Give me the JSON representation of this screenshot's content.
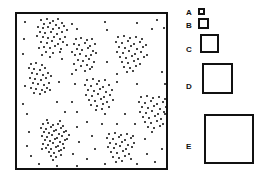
{
  "figure": {
    "title": "",
    "type": "scatter-with-size-legend",
    "width": 259,
    "height": 185,
    "background": "#ffffff",
    "ink_color": "#0a0a0a"
  },
  "plot": {
    "name": "point-pattern-plot",
    "frame": {
      "x": 15,
      "y": 12,
      "width": 153,
      "height": 158
    },
    "border_color": "#111111",
    "border_width": 2,
    "axis_labels_shown": false,
    "tick_labels_shown": false,
    "gridlines": false
  },
  "legend": {
    "name": "size-legend",
    "orientation": "vertical",
    "position": "right",
    "border_color": "#111111",
    "border_width": 2,
    "fill_color": "#ffffff",
    "items": [
      {
        "label": "A",
        "size": 7,
        "label_x": 2,
        "label_y": 9,
        "swatch_x": 14,
        "swatch_y": 8
      },
      {
        "label": "B",
        "size": 11,
        "label_x": 2,
        "label_y": 22,
        "swatch_x": 14,
        "swatch_y": 18
      },
      {
        "label": "C",
        "size": 19,
        "label_x": 2,
        "label_y": 46,
        "swatch_x": 16,
        "swatch_y": 34
      },
      {
        "label": "D",
        "size": 31,
        "label_x": 2,
        "label_y": 83,
        "swatch_x": 18,
        "swatch_y": 63
      },
      {
        "label": "E",
        "size": 50,
        "label_x": 2,
        "label_y": 143,
        "swatch_x": 20,
        "swatch_y": 114
      }
    ]
  },
  "chart_data": {
    "type": "scatter",
    "title": "",
    "xlabel": "",
    "ylabel": "",
    "xlim": [
      0,
      153
    ],
    "ylim": [
      0,
      158
    ],
    "grid": false,
    "legend_position": "right",
    "marker": {
      "shape": "circle",
      "color": "#0a0a0a",
      "size_px": 2
    },
    "cluster_count": 8,
    "total_points": 332,
    "clusters": [
      {
        "name": "top-left",
        "center": [
          33,
          19
        ],
        "n": 42,
        "radius": 17,
        "density": "high"
      },
      {
        "name": "left-middle",
        "center": [
          22,
          61
        ],
        "n": 28,
        "radius": 13,
        "density": "medium"
      },
      {
        "name": "upper-center",
        "center": [
          68,
          35
        ],
        "n": 30,
        "radius": 13,
        "density": "medium"
      },
      {
        "name": "upper-right",
        "center": [
          113,
          37
        ],
        "n": 36,
        "radius": 15,
        "density": "high"
      },
      {
        "name": "center",
        "center": [
          81,
          78
        ],
        "n": 30,
        "radius": 13,
        "density": "medium"
      },
      {
        "name": "right-middle",
        "center": [
          136,
          95
        ],
        "n": 32,
        "radius": 14,
        "density": "high"
      },
      {
        "name": "bottom-left",
        "center": [
          36,
          121
        ],
        "n": 48,
        "radius": 13,
        "density": "very-high"
      },
      {
        "name": "bottom-center",
        "center": [
          103,
          130
        ],
        "n": 30,
        "radius": 12,
        "density": "medium"
      }
    ],
    "background_points": 56,
    "points": [
      [
        24,
        6
      ],
      [
        30,
        5
      ],
      [
        36,
        7
      ],
      [
        41,
        5
      ],
      [
        27,
        10
      ],
      [
        33,
        9
      ],
      [
        39,
        11
      ],
      [
        45,
        9
      ],
      [
        21,
        13
      ],
      [
        26,
        14
      ],
      [
        31,
        13
      ],
      [
        36,
        15
      ],
      [
        42,
        14
      ],
      [
        47,
        12
      ],
      [
        23,
        18
      ],
      [
        28,
        19
      ],
      [
        34,
        18
      ],
      [
        40,
        20
      ],
      [
        45,
        18
      ],
      [
        50,
        16
      ],
      [
        20,
        22
      ],
      [
        26,
        23
      ],
      [
        31,
        24
      ],
      [
        37,
        23
      ],
      [
        43,
        25
      ],
      [
        48,
        23
      ],
      [
        24,
        28
      ],
      [
        30,
        29
      ],
      [
        35,
        27
      ],
      [
        41,
        30
      ],
      [
        46,
        28
      ],
      [
        27,
        33
      ],
      [
        33,
        34
      ],
      [
        38,
        32
      ],
      [
        44,
        35
      ],
      [
        22,
        34
      ],
      [
        50,
        31
      ],
      [
        29,
        38
      ],
      [
        36,
        39
      ],
      [
        43,
        38
      ],
      [
        25,
        41
      ],
      [
        33,
        43
      ],
      [
        14,
        50
      ],
      [
        19,
        49
      ],
      [
        25,
        51
      ],
      [
        12,
        54
      ],
      [
        17,
        55
      ],
      [
        23,
        56
      ],
      [
        28,
        54
      ],
      [
        15,
        59
      ],
      [
        20,
        60
      ],
      [
        26,
        61
      ],
      [
        31,
        59
      ],
      [
        13,
        64
      ],
      [
        18,
        65
      ],
      [
        24,
        66
      ],
      [
        29,
        64
      ],
      [
        34,
        62
      ],
      [
        16,
        69
      ],
      [
        21,
        70
      ],
      [
        27,
        71
      ],
      [
        32,
        69
      ],
      [
        14,
        74
      ],
      [
        19,
        75
      ],
      [
        25,
        76
      ],
      [
        30,
        74
      ],
      [
        17,
        79
      ],
      [
        23,
        80
      ],
      [
        28,
        78
      ],
      [
        33,
        76
      ],
      [
        59,
        25
      ],
      [
        64,
        24
      ],
      [
        70,
        26
      ],
      [
        75,
        25
      ],
      [
        57,
        30
      ],
      [
        62,
        31
      ],
      [
        68,
        29
      ],
      [
        73,
        32
      ],
      [
        78,
        30
      ],
      [
        60,
        35
      ],
      [
        65,
        36
      ],
      [
        71,
        34
      ],
      [
        76,
        37
      ],
      [
        55,
        38
      ],
      [
        58,
        41
      ],
      [
        63,
        40
      ],
      [
        69,
        42
      ],
      [
        74,
        41
      ],
      [
        79,
        39
      ],
      [
        61,
        46
      ],
      [
        66,
        47
      ],
      [
        72,
        45
      ],
      [
        77,
        48
      ],
      [
        57,
        50
      ],
      [
        64,
        52
      ],
      [
        70,
        51
      ],
      [
        75,
        53
      ],
      [
        59,
        56
      ],
      [
        68,
        57
      ],
      [
        73,
        55
      ],
      [
        101,
        23
      ],
      [
        107,
        22
      ],
      [
        113,
        24
      ],
      [
        119,
        23
      ],
      [
        125,
        25
      ],
      [
        99,
        28
      ],
      [
        105,
        29
      ],
      [
        111,
        27
      ],
      [
        117,
        30
      ],
      [
        123,
        28
      ],
      [
        129,
        31
      ],
      [
        102,
        33
      ],
      [
        108,
        34
      ],
      [
        114,
        32
      ],
      [
        120,
        35
      ],
      [
        126,
        33
      ],
      [
        100,
        38
      ],
      [
        106,
        39
      ],
      [
        112,
        37
      ],
      [
        118,
        40
      ],
      [
        124,
        38
      ],
      [
        130,
        41
      ],
      [
        103,
        43
      ],
      [
        109,
        44
      ],
      [
        115,
        42
      ],
      [
        121,
        45
      ],
      [
        127,
        43
      ],
      [
        105,
        48
      ],
      [
        111,
        49
      ],
      [
        117,
        47
      ],
      [
        123,
        50
      ],
      [
        107,
        53
      ],
      [
        113,
        54
      ],
      [
        119,
        52
      ],
      [
        110,
        58
      ],
      [
        116,
        57
      ],
      [
        70,
        66
      ],
      [
        76,
        65
      ],
      [
        82,
        67
      ],
      [
        88,
        66
      ],
      [
        68,
        71
      ],
      [
        74,
        72
      ],
      [
        80,
        70
      ],
      [
        86,
        73
      ],
      [
        92,
        71
      ],
      [
        71,
        76
      ],
      [
        77,
        77
      ],
      [
        83,
        75
      ],
      [
        89,
        78
      ],
      [
        95,
        76
      ],
      [
        69,
        81
      ],
      [
        75,
        82
      ],
      [
        81,
        80
      ],
      [
        87,
        83
      ],
      [
        93,
        81
      ],
      [
        72,
        86
      ],
      [
        78,
        87
      ],
      [
        84,
        85
      ],
      [
        90,
        88
      ],
      [
        96,
        86
      ],
      [
        74,
        91
      ],
      [
        80,
        92
      ],
      [
        86,
        90
      ],
      [
        92,
        93
      ],
      [
        79,
        96
      ],
      [
        85,
        95
      ],
      [
        124,
        83
      ],
      [
        130,
        82
      ],
      [
        136,
        84
      ],
      [
        142,
        83
      ],
      [
        148,
        85
      ],
      [
        122,
        88
      ],
      [
        128,
        89
      ],
      [
        134,
        87
      ],
      [
        140,
        90
      ],
      [
        146,
        88
      ],
      [
        125,
        93
      ],
      [
        131,
        94
      ],
      [
        137,
        92
      ],
      [
        143,
        95
      ],
      [
        149,
        93
      ],
      [
        123,
        98
      ],
      [
        129,
        99
      ],
      [
        135,
        97
      ],
      [
        141,
        100
      ],
      [
        147,
        98
      ],
      [
        126,
        103
      ],
      [
        132,
        104
      ],
      [
        138,
        102
      ],
      [
        144,
        105
      ],
      [
        128,
        108
      ],
      [
        134,
        109
      ],
      [
        140,
        107
      ],
      [
        146,
        110
      ],
      [
        131,
        113
      ],
      [
        137,
        114
      ],
      [
        143,
        112
      ],
      [
        135,
        118
      ],
      [
        26,
        110
      ],
      [
        31,
        109
      ],
      [
        36,
        111
      ],
      [
        41,
        110
      ],
      [
        46,
        112
      ],
      [
        24,
        114
      ],
      [
        29,
        115
      ],
      [
        34,
        113
      ],
      [
        39,
        116
      ],
      [
        44,
        114
      ],
      [
        49,
        117
      ],
      [
        27,
        118
      ],
      [
        32,
        119
      ],
      [
        37,
        117
      ],
      [
        42,
        120
      ],
      [
        47,
        118
      ],
      [
        52,
        121
      ],
      [
        25,
        122
      ],
      [
        30,
        123
      ],
      [
        35,
        121
      ],
      [
        40,
        124
      ],
      [
        45,
        122
      ],
      [
        50,
        125
      ],
      [
        28,
        126
      ],
      [
        33,
        127
      ],
      [
        38,
        125
      ],
      [
        43,
        128
      ],
      [
        48,
        126
      ],
      [
        26,
        130
      ],
      [
        31,
        131
      ],
      [
        36,
        129
      ],
      [
        41,
        132
      ],
      [
        46,
        130
      ],
      [
        29,
        134
      ],
      [
        34,
        135
      ],
      [
        39,
        133
      ],
      [
        44,
        136
      ],
      [
        32,
        138
      ],
      [
        37,
        139
      ],
      [
        42,
        137
      ],
      [
        34,
        142
      ],
      [
        39,
        143
      ],
      [
        30,
        106
      ],
      [
        43,
        107
      ],
      [
        47,
        134
      ],
      [
        25,
        135
      ],
      [
        36,
        146
      ],
      [
        44,
        141
      ],
      [
        92,
        120
      ],
      [
        98,
        119
      ],
      [
        104,
        121
      ],
      [
        110,
        120
      ],
      [
        116,
        122
      ],
      [
        90,
        124
      ],
      [
        96,
        125
      ],
      [
        102,
        123
      ],
      [
        108,
        126
      ],
      [
        114,
        124
      ],
      [
        93,
        129
      ],
      [
        99,
        130
      ],
      [
        105,
        128
      ],
      [
        111,
        131
      ],
      [
        117,
        129
      ],
      [
        91,
        133
      ],
      [
        97,
        134
      ],
      [
        103,
        132
      ],
      [
        109,
        135
      ],
      [
        115,
        133
      ],
      [
        94,
        138
      ],
      [
        100,
        139
      ],
      [
        106,
        137
      ],
      [
        112,
        140
      ],
      [
        96,
        143
      ],
      [
        102,
        144
      ],
      [
        108,
        142
      ],
      [
        114,
        145
      ],
      [
        99,
        148
      ],
      [
        105,
        147
      ],
      [
        8,
        8
      ],
      [
        55,
        10
      ],
      [
        88,
        8
      ],
      [
        120,
        9
      ],
      [
        140,
        6
      ],
      [
        147,
        14
      ],
      [
        7,
        25
      ],
      [
        60,
        15
      ],
      [
        90,
        16
      ],
      [
        135,
        15
      ],
      [
        6,
        40
      ],
      [
        45,
        45
      ],
      [
        55,
        60
      ],
      [
        90,
        48
      ],
      [
        100,
        60
      ],
      [
        145,
        58
      ],
      [
        8,
        72
      ],
      [
        42,
        68
      ],
      [
        58,
        70
      ],
      [
        100,
        68
      ],
      [
        120,
        70
      ],
      [
        148,
        70
      ],
      [
        6,
        90
      ],
      [
        40,
        88
      ],
      [
        55,
        88
      ],
      [
        60,
        98
      ],
      [
        108,
        100
      ],
      [
        150,
        120
      ],
      [
        10,
        100
      ],
      [
        48,
        98
      ],
      [
        70,
        108
      ],
      [
        85,
        110
      ],
      [
        100,
        110
      ],
      [
        118,
        110
      ],
      [
        145,
        135
      ],
      [
        12,
        118
      ],
      [
        60,
        113
      ],
      [
        75,
        122
      ],
      [
        88,
        100
      ],
      [
        128,
        125
      ],
      [
        10,
        132
      ],
      [
        62,
        128
      ],
      [
        78,
        135
      ],
      [
        130,
        140
      ],
      [
        150,
        145
      ],
      [
        14,
        142
      ],
      [
        56,
        140
      ],
      [
        70,
        145
      ],
      [
        88,
        150
      ],
      [
        120,
        150
      ],
      [
        138,
        148
      ],
      [
        22,
        150
      ],
      [
        40,
        152
      ],
      [
        60,
        152
      ],
      [
        100,
        155
      ],
      [
        148,
        100
      ]
    ]
  }
}
